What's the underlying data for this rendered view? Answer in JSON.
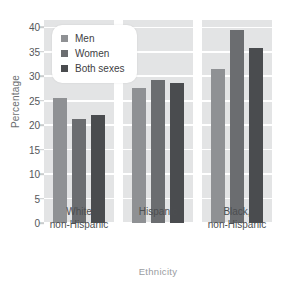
{
  "chart_data": {
    "type": "bar",
    "title": "",
    "xlabel": "Ethnicity",
    "ylabel": "Percentage",
    "categories": [
      "White non-Hispanic",
      "Hispanic",
      "Black, non-Hispanic"
    ],
    "category_lines": [
      [
        "White",
        "non-Hispanic"
      ],
      [
        "Hispanic",
        ""
      ],
      [
        "Black,",
        "non-Hispanic"
      ]
    ],
    "series": [
      {
        "name": "Men",
        "color": "#8f9194",
        "values": [
          25.6,
          27.5,
          31.5
        ]
      },
      {
        "name": "Women",
        "color": "#6b6d70",
        "values": [
          21.2,
          29.3,
          39.5
        ]
      },
      {
        "name": "Both sexes",
        "color": "#4a4c4f",
        "values": [
          22.1,
          28.6,
          35.8
        ]
      }
    ],
    "ylim": [
      0,
      41.5
    ],
    "yticks": [
      0,
      5,
      10,
      15,
      20,
      25,
      30,
      35,
      40
    ],
    "ytick_labels": [
      "0",
      "5",
      "10",
      "15",
      "20",
      "25",
      "30",
      "35",
      "40"
    ],
    "grid": true,
    "legend_position": "top-left",
    "plot_background": "#e3e4e5",
    "gridline_color": "#ffffff"
  }
}
